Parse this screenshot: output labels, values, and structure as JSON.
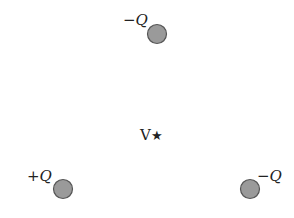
{
  "diagram": {
    "charges": [
      {
        "id": "top",
        "label": "−Q",
        "sign": "−",
        "symbol": "Q",
        "cx": 157,
        "cy": 34
      },
      {
        "id": "bottom-left",
        "label": "+Q",
        "sign": "+",
        "symbol": "Q",
        "cx": 63,
        "cy": 189
      },
      {
        "id": "bottom-right",
        "label": "−Q",
        "sign": "−",
        "symbol": "Q",
        "cx": 250,
        "cy": 189
      }
    ],
    "point": {
      "label": "V",
      "marker": "★",
      "cx": 157,
      "cy": 135
    },
    "colors": {
      "charge_fill": "#9a9a9a",
      "charge_stroke": "#555555",
      "text": "#222222"
    }
  }
}
